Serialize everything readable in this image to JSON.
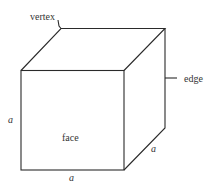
{
  "diagram": {
    "type": "cube",
    "stroke_color": "#2a2a2a",
    "text_color": "#333333",
    "labels": {
      "vertex": "vertex",
      "edge": "edge",
      "face": "face",
      "side_left": "a",
      "side_bottom": "a",
      "side_right": "a"
    }
  }
}
